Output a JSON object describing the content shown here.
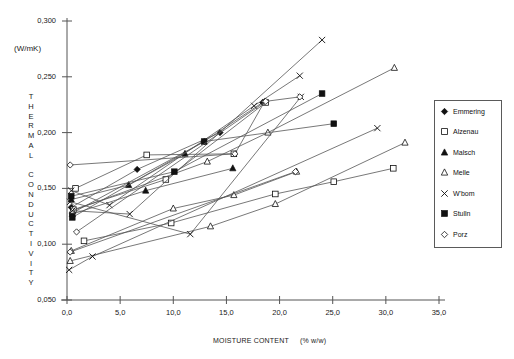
{
  "chart_data": {
    "type": "line",
    "title": "",
    "xlabel": "MOISTURE CONTENT",
    "xunit": "(%  w/w)",
    "ylabel": "THERMAL CONDUCTIVITY",
    "yunit": "(W/mK)",
    "xlim": [
      0,
      35
    ],
    "ylim": [
      0.05,
      0.3
    ],
    "xticks": [
      "0,0",
      "5,0",
      "10,0",
      "15,0",
      "20,0",
      "25,0",
      "30,0",
      "35,0"
    ],
    "xtick_values": [
      0,
      5,
      10,
      15,
      20,
      25,
      30,
      35
    ],
    "yticks": [
      "0,300",
      "0,250",
      "0,200",
      "0,150",
      "0,100",
      "0,050"
    ],
    "ytick_values": [
      0.3,
      0.25,
      0.2,
      0.15,
      0.1,
      0.05
    ],
    "grid": false,
    "legend_position": "right",
    "legend": [
      "Emmering",
      "Alzenau",
      "Malsch",
      "Melle",
      "W'bom",
      "Stulln",
      "Porz"
    ],
    "series": [
      {
        "name": "Emmering",
        "marker": "filled-diamond",
        "points": [
          [
            0.4,
            0.133
          ],
          [
            6.6,
            0.167
          ],
          [
            14.4,
            0.2
          ]
        ]
      },
      {
        "name": "Emmering",
        "marker": "filled-diamond",
        "points": [
          [
            0.5,
            0.128
          ],
          [
            12.9,
            0.192
          ],
          [
            18.4,
            0.227
          ]
        ]
      },
      {
        "name": "Alzenau",
        "marker": "open-square",
        "points": [
          [
            0.8,
            0.15
          ],
          [
            7.5,
            0.18
          ],
          [
            15.7,
            0.181
          ]
        ]
      },
      {
        "name": "Alzenau",
        "marker": "open-square",
        "points": [
          [
            0.6,
            0.131
          ],
          [
            9.3,
            0.158
          ],
          [
            18.7,
            0.227
          ]
        ]
      },
      {
        "name": "Alzenau",
        "marker": "open-square",
        "points": [
          [
            1.6,
            0.103
          ],
          [
            9.8,
            0.119
          ],
          [
            19.6,
            0.145
          ],
          [
            25.1,
            0.156
          ],
          [
            30.7,
            0.168
          ]
        ]
      },
      {
        "name": "Malsch",
        "marker": "filled-triangle",
        "points": [
          [
            0.4,
            0.14
          ],
          [
            5.8,
            0.153
          ],
          [
            11.1,
            0.181
          ]
        ]
      },
      {
        "name": "Malsch",
        "marker": "filled-triangle",
        "points": [
          [
            0.5,
            0.127
          ],
          [
            7.4,
            0.148
          ],
          [
            15.6,
            0.168
          ]
        ]
      },
      {
        "name": "Melle",
        "marker": "open-triangle",
        "points": [
          [
            0.3,
            0.085
          ],
          [
            13.5,
            0.116
          ],
          [
            19.6,
            0.136
          ],
          [
            31.8,
            0.191
          ]
        ]
      },
      {
        "name": "Melle",
        "marker": "open-triangle",
        "points": [
          [
            0.4,
            0.094
          ],
          [
            10.0,
            0.132
          ],
          [
            15.7,
            0.144
          ],
          [
            21.6,
            0.165
          ]
        ]
      },
      {
        "name": "Melle",
        "marker": "open-triangle",
        "points": [
          [
            0.5,
            0.13
          ],
          [
            13.2,
            0.174
          ],
          [
            18.9,
            0.2
          ],
          [
            30.8,
            0.258
          ]
        ]
      },
      {
        "name": "W'bom",
        "marker": "cross",
        "points": [
          [
            0.4,
            0.148
          ],
          [
            4.0,
            0.135
          ],
          [
            17.6,
            0.224
          ],
          [
            21.9,
            0.251
          ]
        ]
      },
      {
        "name": "W'bom",
        "marker": "cross",
        "points": [
          [
            0.3,
            0.138
          ],
          [
            11.6,
            0.109
          ],
          [
            22.0,
            0.232
          ]
        ]
      },
      {
        "name": "W'bom",
        "marker": "cross",
        "points": [
          [
            0.2,
            0.077
          ],
          [
            2.4,
            0.089
          ],
          [
            29.2,
            0.204
          ]
        ]
      },
      {
        "name": "W'bom",
        "marker": "cross",
        "points": [
          [
            0.5,
            0.13
          ],
          [
            5.9,
            0.127
          ],
          [
            24.0,
            0.283
          ]
        ]
      },
      {
        "name": "Stulln",
        "marker": "filled-square",
        "points": [
          [
            0.4,
            0.143
          ],
          [
            10.1,
            0.165
          ],
          [
            24.0,
            0.235
          ]
        ]
      },
      {
        "name": "Stulln",
        "marker": "filled-square",
        "points": [
          [
            0.5,
            0.124
          ],
          [
            12.9,
            0.192
          ],
          [
            25.1,
            0.208
          ]
        ]
      },
      {
        "name": "Porz",
        "marker": "open-diamond",
        "points": [
          [
            0.3,
            0.171
          ],
          [
            15.8,
            0.181
          ],
          [
            18.6,
            0.228
          ]
        ]
      },
      {
        "name": "Porz",
        "marker": "open-diamond",
        "points": [
          [
            0.3,
            0.093
          ],
          [
            21.5,
            0.165
          ]
        ]
      },
      {
        "name": "Porz",
        "marker": "open-diamond",
        "points": [
          [
            0.9,
            0.111
          ],
          [
            18.7,
            0.228
          ],
          [
            21.9,
            0.232
          ]
        ]
      }
    ]
  },
  "legend_panel": {
    "items": [
      {
        "label": "Emmering",
        "marker": "filled-diamond"
      },
      {
        "label": "Alzenau",
        "marker": "open-square"
      },
      {
        "label": "Malsch",
        "marker": "filled-triangle"
      },
      {
        "label": "Melle",
        "marker": "open-triangle"
      },
      {
        "label": "W'bom",
        "marker": "cross"
      },
      {
        "label": "Stulln",
        "marker": "filled-square"
      },
      {
        "label": "Porz",
        "marker": "open-diamond"
      }
    ]
  },
  "colors": {
    "line": "#555555",
    "marker": "#111111",
    "axis": "#555555",
    "text": "#1a1a1a"
  }
}
